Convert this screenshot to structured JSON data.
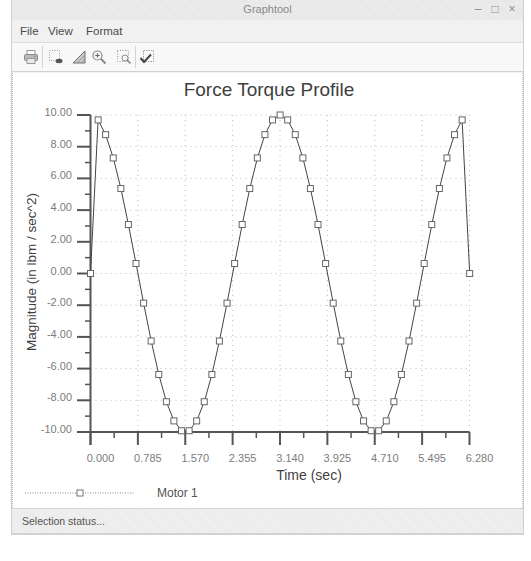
{
  "window": {
    "title": "Graphtool",
    "controls": {
      "minimize": "–",
      "maximize": "□",
      "close": "×"
    }
  },
  "menu": {
    "items": [
      {
        "label": "File"
      },
      {
        "label": "View"
      },
      {
        "label": "Format"
      }
    ]
  },
  "toolbar": {
    "buttons": [
      {
        "icon": "print-icon"
      },
      {
        "icon": "select-points-icon"
      },
      {
        "icon": "area-fill-icon"
      },
      {
        "icon": "zoom-in-icon"
      },
      {
        "icon": "zoom-rect-icon"
      },
      {
        "icon": "check-document-icon"
      }
    ]
  },
  "legend": {
    "items": [
      {
        "label": "Motor 1",
        "marker": "square"
      }
    ]
  },
  "status": {
    "text": "Selection status..."
  },
  "colors": {
    "line": "#444444",
    "marker_stroke": "#666666",
    "grid": "#bdbdbd",
    "axis": "#555555"
  },
  "chart_data": {
    "type": "line",
    "title": "Force Torque Profile",
    "xlabel": "Time (sec)",
    "ylabel": "Magnitude (in lbm / sec^2)",
    "xlim": [
      0,
      6.28
    ],
    "ylim": [
      -10,
      10
    ],
    "xticks": [
      0,
      0.785,
      1.57,
      2.355,
      3.14,
      3.925,
      4.71,
      5.495,
      6.28
    ],
    "xtick_labels": [
      "0.000",
      "0.785",
      "1.570",
      "2.355",
      "3.140",
      "3.925",
      "4.710",
      "5.495",
      "6.280"
    ],
    "yticks": [
      10,
      8,
      6,
      4,
      2,
      0,
      -2,
      -4,
      -6,
      -8,
      -10
    ],
    "ytick_labels": [
      "10.00",
      "8.00",
      "6.00",
      "4.00",
      "2.00",
      "0.00",
      "-2.00",
      "-4.00",
      "-6.00",
      "-8.00",
      "-10.00"
    ],
    "grid": true,
    "legend_position": "bottom-left",
    "series": [
      {
        "name": "Motor 1",
        "marker": "square",
        "x": [
          0,
          0.126,
          0.251,
          0.377,
          0.503,
          0.628,
          0.754,
          0.88,
          1.005,
          1.131,
          1.257,
          1.382,
          1.508,
          1.634,
          1.759,
          1.885,
          2.011,
          2.136,
          2.262,
          2.388,
          2.513,
          2.639,
          2.765,
          2.89,
          3.016,
          3.142,
          3.267,
          3.393,
          3.519,
          3.644,
          3.77,
          3.896,
          4.021,
          4.147,
          4.273,
          4.398,
          4.524,
          4.65,
          4.775,
          4.901,
          5.027,
          5.152,
          5.278,
          5.404,
          5.529,
          5.655,
          5.781,
          5.906,
          6.032,
          6.158,
          6.283
        ],
        "y": [
          0,
          9.69,
          8.76,
          7.29,
          5.36,
          3.09,
          0.63,
          -1.87,
          -4.26,
          -6.37,
          -8.09,
          -9.3,
          -9.92,
          -9.92,
          -9.3,
          -8.09,
          -6.37,
          -4.26,
          -1.87,
          0.63,
          3.09,
          5.36,
          7.29,
          8.76,
          9.69,
          10,
          9.69,
          8.76,
          7.29,
          5.36,
          3.09,
          0.63,
          -1.87,
          -4.26,
          -6.37,
          -8.09,
          -9.3,
          -9.92,
          -9.92,
          -9.3,
          -8.09,
          -6.37,
          -4.26,
          -1.87,
          0.63,
          3.09,
          5.36,
          7.29,
          8.76,
          9.69,
          0
        ]
      }
    ]
  }
}
